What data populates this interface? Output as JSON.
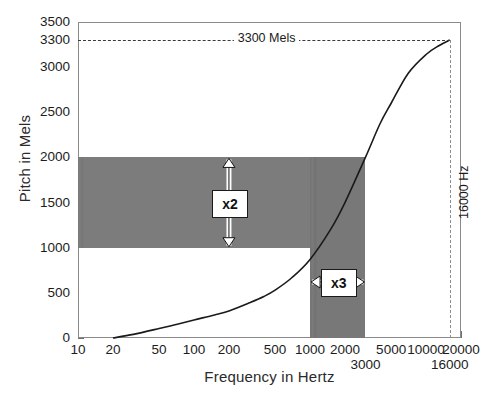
{
  "chart_data": {
    "type": "line",
    "title": "",
    "xlabel": "Frequency in Hertz",
    "ylabel": "Pitch in Mels",
    "xscale": "log",
    "yscale": "linear",
    "xlim": [
      10,
      20000
    ],
    "ylim": [
      0,
      3500
    ],
    "grid": false,
    "legend": null,
    "x_ticks": [
      {
        "value": 10,
        "label": "10",
        "row": 0
      },
      {
        "value": 20,
        "label": "20",
        "row": 0
      },
      {
        "value": 50,
        "label": "50",
        "row": 0
      },
      {
        "value": 100,
        "label": "100",
        "row": 0
      },
      {
        "value": 200,
        "label": "200",
        "row": 0
      },
      {
        "value": 500,
        "label": "500",
        "row": 0
      },
      {
        "value": 1000,
        "label": "1000",
        "row": 0
      },
      {
        "value": 2000,
        "label": "2000",
        "row": 0
      },
      {
        "value": 3000,
        "label": "3000",
        "row": 1
      },
      {
        "value": 5000,
        "label": "5000",
        "row": 0
      },
      {
        "value": 10000,
        "label": "10000",
        "row": 0
      },
      {
        "value": 16000,
        "label": "16000",
        "row": 1
      },
      {
        "value": 20000,
        "label": "20000",
        "row": 0
      }
    ],
    "y_ticks": [
      {
        "value": 0,
        "label": "0"
      },
      {
        "value": 500,
        "label": "500"
      },
      {
        "value": 1000,
        "label": "1000"
      },
      {
        "value": 1500,
        "label": "1500"
      },
      {
        "value": 2000,
        "label": "2000"
      },
      {
        "value": 2500,
        "label": "2500"
      },
      {
        "value": 3000,
        "label": "3000"
      },
      {
        "value": 3300,
        "label": "3300"
      },
      {
        "value": 3500,
        "label": "3500"
      }
    ],
    "series": [
      {
        "name": "Mel scale curve",
        "color": "#1a1a1a",
        "points": [
          [
            20,
            0
          ],
          [
            30,
            40
          ],
          [
            50,
            105
          ],
          [
            70,
            150
          ],
          [
            100,
            200
          ],
          [
            150,
            255
          ],
          [
            200,
            300
          ],
          [
            300,
            390
          ],
          [
            400,
            460
          ],
          [
            500,
            530
          ],
          [
            700,
            670
          ],
          [
            1000,
            870
          ],
          [
            1500,
            1200
          ],
          [
            2000,
            1500
          ],
          [
            3000,
            2000
          ],
          [
            4000,
            2370
          ],
          [
            5000,
            2600
          ],
          [
            7000,
            2930
          ],
          [
            10000,
            3140
          ],
          [
            13000,
            3240
          ],
          [
            16000,
            3300
          ]
        ]
      }
    ],
    "shaded_regions": [
      {
        "name": "pitch-band-x2",
        "orientation": "horizontal",
        "y_range": [
          1000,
          2000
        ],
        "x_range": [
          10,
          3000
        ],
        "color": "#7b7b7b"
      },
      {
        "name": "frequency-band-x3",
        "orientation": "vertical",
        "x_range": [
          1000,
          3000
        ],
        "y_range": [
          0,
          2000
        ],
        "color": "#7b7b7b"
      }
    ],
    "annotations": [
      {
        "name": "x2-label",
        "text": "x2",
        "kind": "double-arrow-vertical",
        "x": 200,
        "y_from": 1000,
        "y_to": 2000
      },
      {
        "name": "x3-label",
        "text": "x3",
        "kind": "double-arrow-horizontal",
        "y": 620,
        "x_from": 1000,
        "x_to": 3000
      },
      {
        "name": "mels-3300-label",
        "text": "3300 Mels",
        "kind": "dashed-guide-horizontal",
        "y": 3300,
        "x_from": 10,
        "x_to": 16000
      },
      {
        "name": "hz-16000-label",
        "text": "16000 Hz",
        "kind": "dashed-guide-vertical",
        "x": 16000,
        "y_from": 0,
        "y_to": 3300
      }
    ]
  }
}
